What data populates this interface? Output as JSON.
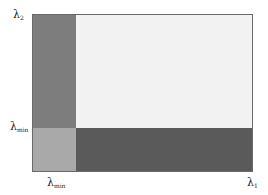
{
  "diagram": {
    "axes": {
      "x_label": "λ",
      "x_label_sub": "1",
      "y_label": "λ",
      "y_label_sub": "2",
      "x_threshold_label": "λ",
      "x_threshold_sub": "min",
      "y_threshold_label": "λ",
      "y_threshold_sub": "min"
    },
    "regions": [
      {
        "name": "main-region",
        "position": "λ1 > λmin, λ2 > λmin",
        "color": "#f2f2f2"
      },
      {
        "name": "left-strip",
        "position": "λ1 < λmin, λ2 > λmin",
        "color": "#7d7d7d"
      },
      {
        "name": "bottom-strip",
        "position": "λ1 > λmin, λ2 < λmin",
        "color": "#5a5a5a"
      },
      {
        "name": "corner-region",
        "position": "λ1 < λmin, λ2 < λmin",
        "color": "#a9a9a9"
      }
    ],
    "colors": {
      "border": "#6a6a6a",
      "background": "#ffffff"
    }
  }
}
